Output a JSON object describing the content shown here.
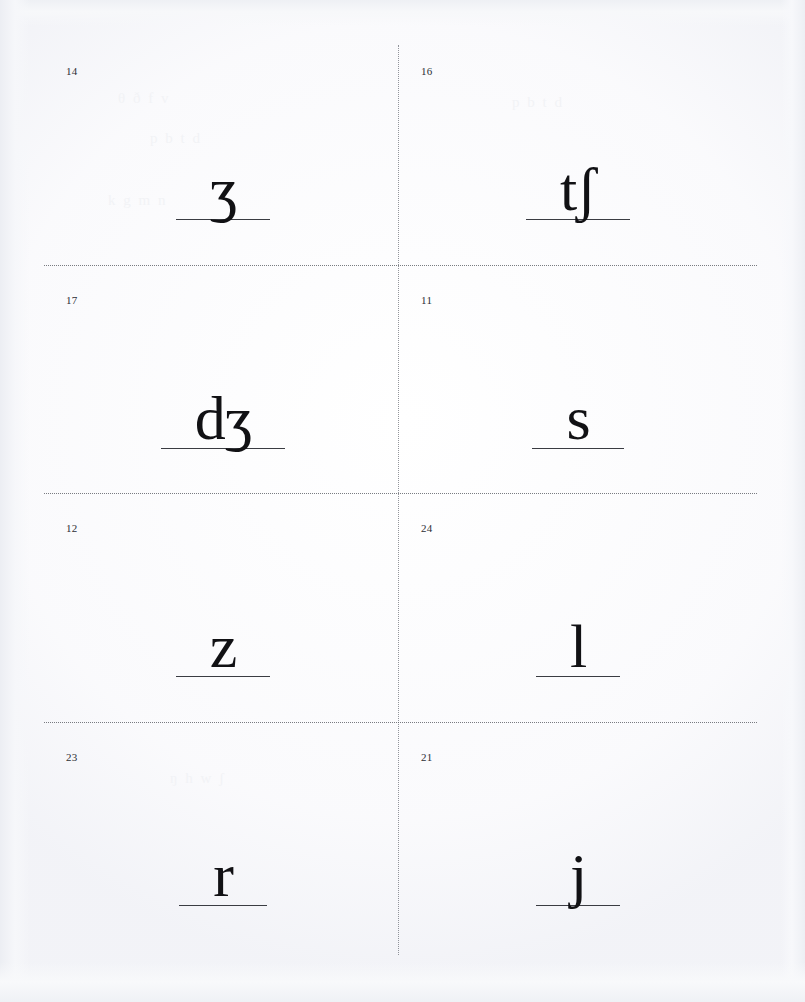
{
  "sheet": {
    "title": "IPA consonant flashcard sheet",
    "description": "Scanned page of eight cut-out flashcards, each showing an IPA phonetic symbol written on a baseline rule with a small card number in the upper-left corner.",
    "columns": 2,
    "rows": 4,
    "ink_color": "#111114",
    "rule_color": "#3a3c42",
    "cut_guide_color": "#55585f",
    "paper_color": "#ffffff"
  },
  "cards": [
    {
      "number": "14",
      "symbol": "ʒ",
      "symbol_name": "ezh",
      "row": 1,
      "column": 1
    },
    {
      "number": "16",
      "symbol": "tʃ",
      "symbol_name": "t-esh",
      "row": 1,
      "column": 2
    },
    {
      "number": "17",
      "symbol": "dʒ",
      "symbol_name": "d-ezh",
      "row": 2,
      "column": 1
    },
    {
      "number": "11",
      "symbol": "s",
      "symbol_name": "s",
      "row": 2,
      "column": 2
    },
    {
      "number": "12",
      "symbol": "z",
      "symbol_name": "z",
      "row": 3,
      "column": 1
    },
    {
      "number": "24",
      "symbol": "l",
      "symbol_name": "l",
      "row": 3,
      "column": 2
    },
    {
      "number": "23",
      "symbol": "r",
      "symbol_name": "r",
      "row": 4,
      "column": 1
    },
    {
      "number": "21",
      "symbol": "j",
      "symbol_name": "j",
      "row": 4,
      "column": 2
    }
  ],
  "cut_guides": {
    "horizontal_count": 3,
    "vertical_count": 1
  },
  "ghost_text": {
    "line1": "θ ð  f  v",
    "line2": "p  b  t  d",
    "line3": "k  g  m  n",
    "line4": "ŋ  h  w  ʃ"
  }
}
